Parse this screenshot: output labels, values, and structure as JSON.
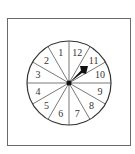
{
  "spinner": {
    "sections": 12,
    "labels": [
      "1",
      "2",
      "3",
      "4",
      "5",
      "6",
      "7",
      "8",
      "9",
      "10",
      "11",
      "12"
    ],
    "pointer_target": "11",
    "colors": {
      "line": "#333333",
      "frame": "#6a6a6a",
      "pointer": "#111111"
    }
  }
}
